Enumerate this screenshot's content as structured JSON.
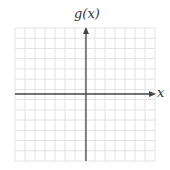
{
  "diagram": {
    "type": "blank coordinate grid",
    "y_axis_label": "g(x)",
    "x_axis_label": "x",
    "grid": {
      "columns": 14,
      "rows": 13,
      "line_color": "#e2e2e2",
      "axis_color": "#444444"
    }
  }
}
